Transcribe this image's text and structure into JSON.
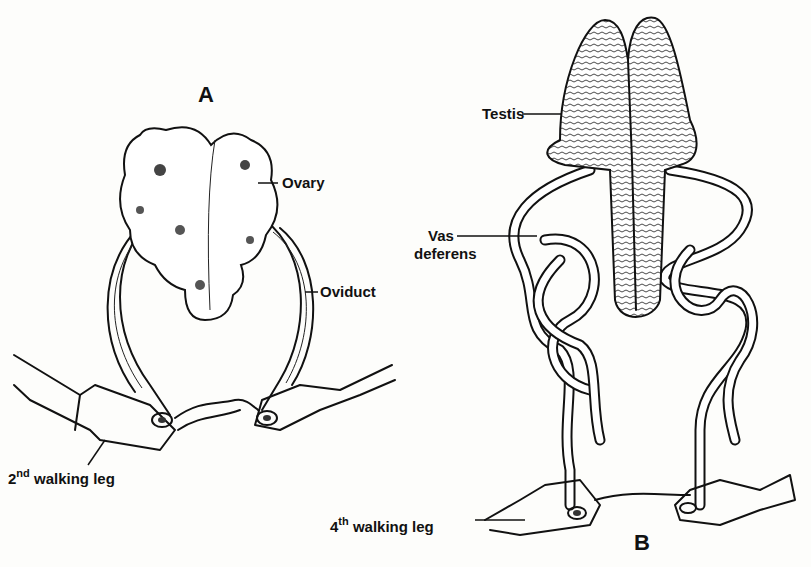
{
  "figure": {
    "panels": [
      {
        "id": "A",
        "label": "A",
        "parts": {
          "ovary": "Ovary",
          "oviduct": "Oviduct",
          "leg_ordinal": "2",
          "leg_suffix": "nd",
          "leg_text": "walking leg"
        }
      },
      {
        "id": "B",
        "label": "B",
        "parts": {
          "testis": "Testis",
          "vas_line1": "Vas",
          "vas_line2": "deferens",
          "leg_ordinal": "4",
          "leg_suffix": "th",
          "leg_text": "walking leg"
        }
      }
    ],
    "colors": {
      "ink": "#111111",
      "paper": "#fdfdfb"
    }
  }
}
